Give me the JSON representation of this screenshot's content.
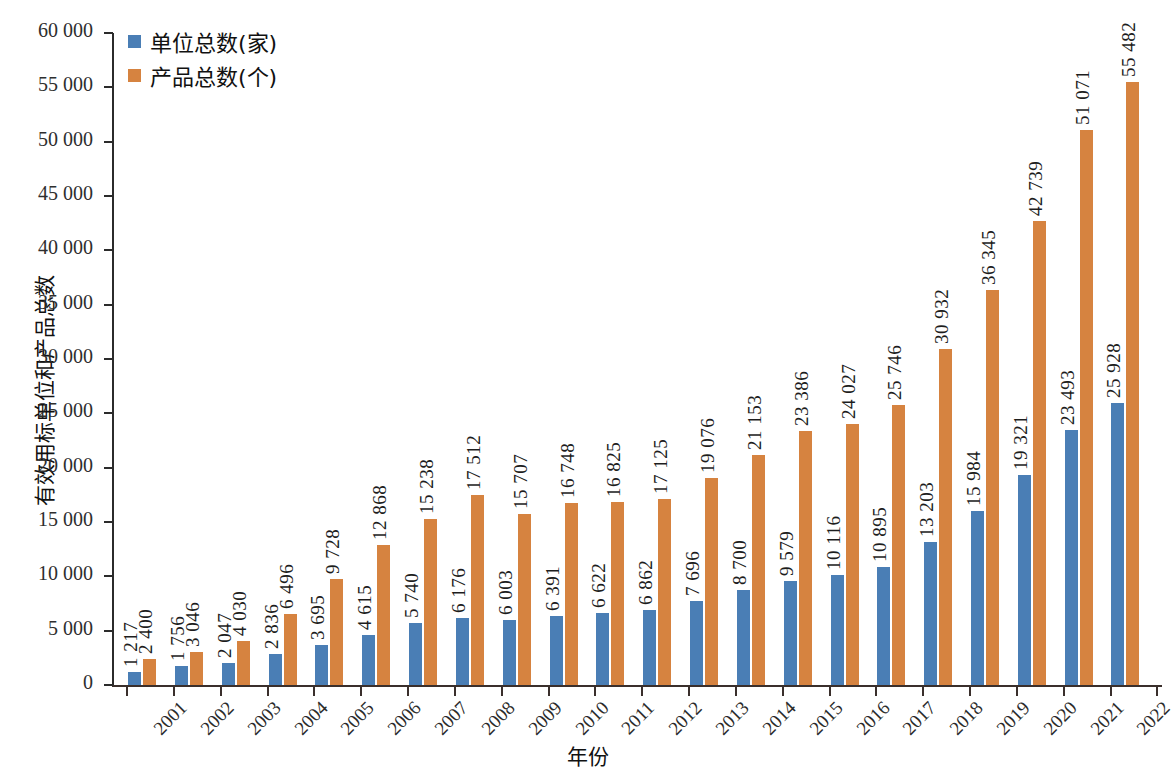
{
  "chart_data": {
    "type": "bar",
    "title": "",
    "xlabel": "年份",
    "ylabel": "有效用标单位和产品总数",
    "ylim": [
      0,
      60000
    ],
    "ytick_step": 5000,
    "ytick_labels": [
      "0",
      "5 000",
      "10 000",
      "15 000",
      "20 000",
      "25 000",
      "30 000",
      "35 000",
      "40 000",
      "45 000",
      "50 000",
      "55 000",
      "60 000"
    ],
    "grid": false,
    "legend_position": "top-left",
    "categories": [
      "2001",
      "2002",
      "2003",
      "2004",
      "2005",
      "2006",
      "2007",
      "2008",
      "2009",
      "2010",
      "2011",
      "2012",
      "2013",
      "2014",
      "2015",
      "2016",
      "2017",
      "2018",
      "2019",
      "2020",
      "2021",
      "2022"
    ],
    "series": [
      {
        "name": "单位总数(家)",
        "color": "#4A7EB5",
        "values": [
          1217,
          1756,
          2047,
          2836,
          3695,
          4615,
          5740,
          6176,
          6003,
          6391,
          6622,
          6862,
          7696,
          8700,
          9579,
          10116,
          10895,
          13203,
          15984,
          19321,
          23493,
          25928
        ],
        "value_labels": [
          "1 217",
          "1 756",
          "2 047",
          "2 836",
          "3 695",
          "4 615",
          "5 740",
          "6 176",
          "6 003",
          "6 391",
          "6 622",
          "6 862",
          "7 696",
          "8 700",
          "9 579",
          "10 116",
          "10 895",
          "13 203",
          "15 984",
          "19 321",
          "23 493",
          "25 928"
        ]
      },
      {
        "name": "产品总数(个)",
        "color": "#D68340",
        "values": [
          2400,
          3046,
          4030,
          6496,
          9728,
          12868,
          15238,
          17512,
          15707,
          16748,
          16825,
          17125,
          19076,
          21153,
          23386,
          24027,
          25746,
          30932,
          36345,
          42739,
          51071,
          55482
        ],
        "value_labels": [
          "2 400",
          "3 046",
          "4 030",
          "6 496",
          "9 728",
          "12 868",
          "15 238",
          "17 512",
          "15 707",
          "16 748",
          "16 825",
          "17 125",
          "19 076",
          "21 153",
          "23 386",
          "24 027",
          "25 746",
          "30 932",
          "36 345",
          "42 739",
          "51 071",
          "55 482"
        ]
      }
    ]
  },
  "axes": {
    "y_title": "有效用标单位和产品总数",
    "x_title": "年份"
  },
  "legend": {
    "items": [
      {
        "label": "单位总数(家)",
        "color": "#4A7EB5",
        "icon": "square-marker-icon"
      },
      {
        "label": "产品总数(个)",
        "color": "#D68340",
        "icon": "square-marker-icon"
      }
    ]
  },
  "colors": {
    "series_blue": "#4A7EB5",
    "series_orange": "#D68340",
    "axis": "#3a2f2c",
    "text": "#1d1d1d",
    "background": "#ffffff"
  }
}
